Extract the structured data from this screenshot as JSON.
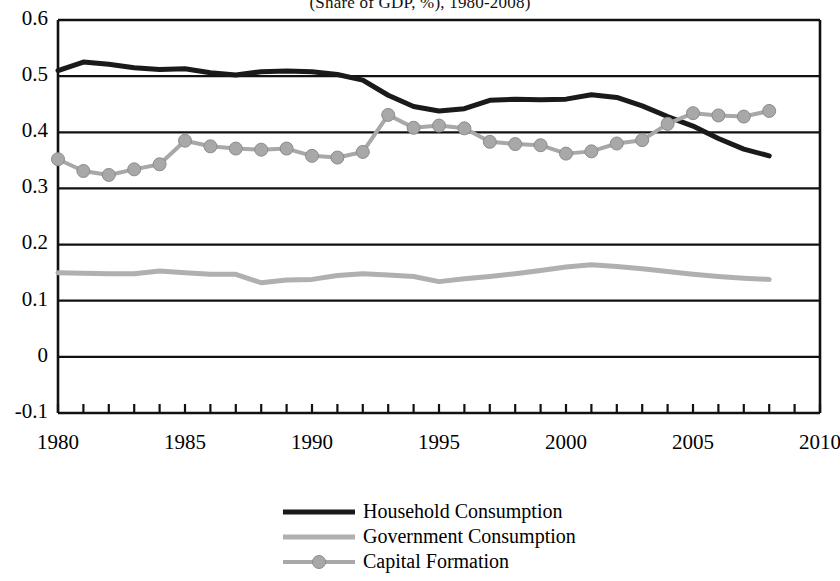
{
  "chart_data": {
    "type": "line",
    "title": "(Share of GDP, %), 1980-2008)",
    "xlabel": "",
    "ylabel": "",
    "xlim": [
      1980,
      2010
    ],
    "ylim": [
      -0.1,
      0.6
    ],
    "yticks": [
      "0.6",
      "0.5",
      "0.4",
      "0.3",
      "0.2",
      "0.1",
      "0",
      "-0.1"
    ],
    "ytick_values": [
      0.6,
      0.5,
      0.4,
      0.3,
      0.2,
      0.1,
      0,
      -0.1
    ],
    "xticks": [
      "1980",
      "1985",
      "1990",
      "1995",
      "2000",
      "2005",
      "2010"
    ],
    "xtick_values": [
      1980,
      1985,
      1990,
      1995,
      2000,
      2005,
      2010
    ],
    "grid": true,
    "legend_position": "bottom",
    "x": [
      1980,
      1981,
      1982,
      1983,
      1984,
      1985,
      1986,
      1987,
      1988,
      1989,
      1990,
      1991,
      1992,
      1993,
      1994,
      1995,
      1996,
      1997,
      1998,
      1999,
      2000,
      2001,
      2002,
      2003,
      2004,
      2005,
      2006,
      2007,
      2008
    ],
    "series": [
      {
        "name": "Household Consumption",
        "color": "#1a1a1a",
        "marker": "none",
        "width": 5,
        "values": [
          0.51,
          0.525,
          0.521,
          0.515,
          0.512,
          0.513,
          0.506,
          0.502,
          0.508,
          0.509,
          0.508,
          0.503,
          0.493,
          0.466,
          0.446,
          0.438,
          0.442,
          0.457,
          0.459,
          0.458,
          0.459,
          0.467,
          0.462,
          0.447,
          0.428,
          0.411,
          0.389,
          0.37,
          0.358
        ]
      },
      {
        "name": "Government Consumption",
        "color": "#b0b0b0",
        "marker": "none",
        "width": 5,
        "values": [
          0.15,
          0.149,
          0.148,
          0.148,
          0.153,
          0.15,
          0.147,
          0.147,
          0.132,
          0.137,
          0.138,
          0.145,
          0.148,
          0.146,
          0.143,
          0.134,
          0.139,
          0.143,
          0.148,
          0.154,
          0.16,
          0.164,
          0.161,
          0.157,
          0.152,
          0.147,
          0.143,
          0.14,
          0.138
        ]
      },
      {
        "name": "Capital Formation",
        "color": "#a8a8a8",
        "marker": "circle",
        "width": 4,
        "values": [
          0.352,
          0.331,
          0.324,
          0.334,
          0.343,
          0.385,
          0.375,
          0.371,
          0.369,
          0.371,
          0.358,
          0.355,
          0.365,
          0.431,
          0.408,
          0.412,
          0.407,
          0.383,
          0.379,
          0.377,
          0.362,
          0.366,
          0.38,
          0.386,
          0.415,
          0.434,
          0.43,
          0.428,
          0.438
        ]
      }
    ]
  },
  "legend": {
    "items": [
      {
        "label": "Household Consumption"
      },
      {
        "label": "Government Consumption"
      },
      {
        "label": "Capital Formation"
      }
    ]
  }
}
